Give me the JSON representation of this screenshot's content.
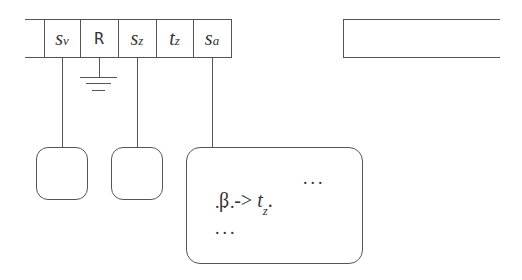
{
  "stack": {
    "cells": [
      {
        "base": "s",
        "sub": "v",
        "style": "italic"
      },
      {
        "base": "R",
        "sub": "",
        "style": "upright"
      },
      {
        "base": "s",
        "sub": "z",
        "style": "italic"
      },
      {
        "base": "t",
        "sub": "z",
        "style": "italic"
      },
      {
        "base": "s",
        "sub": "a",
        "style": "italic"
      }
    ],
    "ground_symbol": "ground"
  },
  "detail_box": {
    "line1_prefix": "β ->",
    "line1_var_base": "t",
    "line1_var_sub": "z",
    "line1_suffix": ".",
    "line1_trailing": "...",
    "line2": "...",
    "line3": "..."
  },
  "colors": {
    "stroke": "#555555",
    "text": "#333333",
    "background": "#ffffff"
  }
}
